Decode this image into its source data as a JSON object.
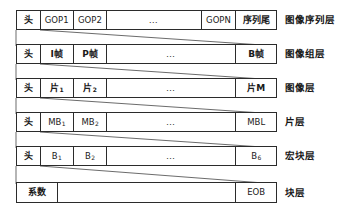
{
  "diagram": {
    "rows": [
      {
        "id": "sequence-layer",
        "label": "图像序列层",
        "cells": [
          {
            "text": "头",
            "kind": "cjk"
          },
          {
            "text": "GOP1",
            "kind": "latin"
          },
          {
            "text": "GOP2",
            "kind": "latin"
          },
          {
            "text": "…",
            "kind": "ellipsis"
          },
          {
            "text": "GOPN",
            "kind": "latin"
          },
          {
            "text": "序列尾",
            "kind": "cjk"
          }
        ]
      },
      {
        "id": "gop-layer",
        "label": "图像组层",
        "cells": [
          {
            "text": "头",
            "kind": "cjk"
          },
          {
            "text": "I帧",
            "kind": "cjk"
          },
          {
            "text": "P帧",
            "kind": "cjk"
          },
          {
            "text": "…",
            "kind": "ellipsis"
          },
          {
            "text": "B帧",
            "kind": "cjk"
          }
        ]
      },
      {
        "id": "picture-layer",
        "label": "图像层",
        "cells": [
          {
            "text": "头",
            "kind": "cjk"
          },
          {
            "text": "片",
            "sub": "1",
            "kind": "cjk"
          },
          {
            "text": "片",
            "sub": "2",
            "kind": "cjk"
          },
          {
            "text": "…",
            "kind": "ellipsis"
          },
          {
            "text": "片M",
            "kind": "cjk"
          }
        ]
      },
      {
        "id": "slice-layer",
        "label": "片层",
        "cells": [
          {
            "text": "头",
            "kind": "cjk"
          },
          {
            "text": "MB",
            "sub": "1",
            "kind": "latin"
          },
          {
            "text": "MB",
            "sub": "2",
            "kind": "latin"
          },
          {
            "text": "…",
            "kind": "ellipsis"
          },
          {
            "text": "MBL",
            "kind": "latin"
          }
        ]
      },
      {
        "id": "macroblock-layer",
        "label": "宏块层",
        "cells": [
          {
            "text": "头",
            "kind": "cjk"
          },
          {
            "text": "B",
            "sub": "1",
            "kind": "latin"
          },
          {
            "text": "B",
            "sub": "2",
            "kind": "latin"
          },
          {
            "text": "…",
            "kind": "ellipsis"
          },
          {
            "text": "B",
            "sub": "6",
            "kind": "latin"
          }
        ]
      },
      {
        "id": "block-layer",
        "label": "块层",
        "cells": [
          {
            "text": "系数",
            "kind": "cjk"
          },
          {
            "text": "",
            "kind": "blank"
          },
          {
            "text": "EOB",
            "kind": "latin"
          }
        ]
      }
    ],
    "colors": {
      "stroke": "#2b2b2b",
      "text": "#161616",
      "background": "#ffffff"
    }
  }
}
